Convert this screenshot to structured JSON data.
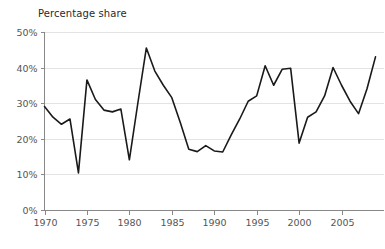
{
  "chart_data": {
    "type": "line",
    "title": "Percentage share",
    "xlabel": "",
    "ylabel": "",
    "ylim": [
      0,
      50
    ],
    "xlim": [
      1970,
      2009
    ],
    "grid": true,
    "legend": "none",
    "y_ticks": [
      0,
      10,
      20,
      30,
      40,
      50
    ],
    "y_tick_labels": [
      "0%",
      "10%",
      "20%",
      "30%",
      "40%",
      "50%"
    ],
    "x_ticks": [
      1970,
      1975,
      1980,
      1985,
      1990,
      1995,
      2000,
      2005
    ],
    "x_tick_labels": [
      "1970",
      "1975",
      "1980",
      "1985",
      "1990",
      "1995",
      "2000",
      "2005"
    ],
    "x": [
      1970,
      1971,
      1972,
      1973,
      1974,
      1975,
      1976,
      1977,
      1978,
      1979,
      1980,
      1981,
      1982,
      1983,
      1984,
      1985,
      1986,
      1987,
      1988,
      1989,
      1990,
      1991,
      1992,
      1993,
      1994,
      1995,
      1996,
      1997,
      1998,
      1999,
      2000,
      2001,
      2002,
      2003,
      2004,
      2005,
      2006,
      2007,
      2008,
      2009
    ],
    "values": [
      29.0,
      26.0,
      24.0,
      25.5,
      10.3,
      36.5,
      31.0,
      28.0,
      27.5,
      28.3,
      14.0,
      30.0,
      45.5,
      39.0,
      35.0,
      31.5,
      24.5,
      17.0,
      16.3,
      18.0,
      16.5,
      16.2,
      21.0,
      25.5,
      30.5,
      32.0,
      40.5,
      35.0,
      39.5,
      39.8,
      18.7,
      26.0,
      27.5,
      32.0,
      40.0,
      35.0,
      30.5,
      27.0,
      34.0,
      43.0
    ],
    "series_name": "Percentage share"
  },
  "axes": {
    "y_axis_name": "percentage-axis",
    "x_axis_name": "year-axis"
  }
}
